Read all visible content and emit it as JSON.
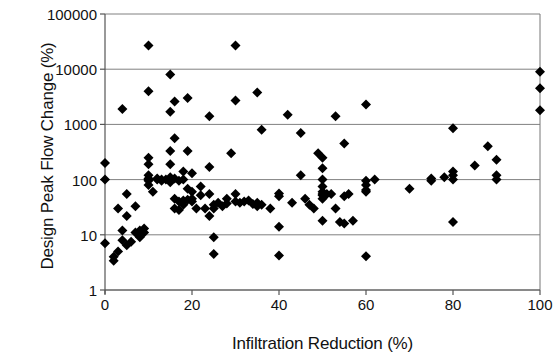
{
  "chart_data": {
    "type": "scatter",
    "title": "",
    "xlabel": "Infiltration Reduction (%)",
    "ylabel": "Design Peak Flow Change (%)",
    "xlim": [
      0,
      100
    ],
    "ylim": [
      1,
      100000
    ],
    "yscale": "log",
    "xscale": "linear",
    "xticks": [
      0,
      20,
      40,
      60,
      80,
      100
    ],
    "xtick_labels": [
      "0",
      "20",
      "40",
      "60",
      "80",
      "100"
    ],
    "yticks": [
      1,
      10,
      100,
      1000,
      10000,
      100000
    ],
    "ytick_labels": [
      "1",
      "10",
      "100",
      "1000",
      "10000",
      "100000"
    ],
    "grid": "horizontal",
    "grid_color": "#808080",
    "marker": "diamond",
    "marker_color": "#000000",
    "marker_size": 5,
    "legend": null,
    "points": [
      [
        0,
        7
      ],
      [
        0,
        100
      ],
      [
        0,
        200
      ],
      [
        2,
        3.4
      ],
      [
        2,
        4.0
      ],
      [
        3,
        5.0
      ],
      [
        3,
        30
      ],
      [
        4,
        1900
      ],
      [
        4,
        8
      ],
      [
        4,
        12
      ],
      [
        5,
        6.5
      ],
      [
        5,
        55
      ],
      [
        5,
        22
      ],
      [
        6,
        7.5
      ],
      [
        7,
        11
      ],
      [
        7,
        33
      ],
      [
        8,
        12
      ],
      [
        8,
        9
      ],
      [
        9,
        11
      ],
      [
        9,
        13
      ],
      [
        10,
        27000
      ],
      [
        10,
        4000
      ],
      [
        10,
        120
      ],
      [
        10,
        190
      ],
      [
        10,
        250
      ],
      [
        10,
        80
      ],
      [
        10,
        95
      ],
      [
        10,
        100
      ],
      [
        10,
        105
      ],
      [
        11,
        60
      ],
      [
        12,
        100
      ],
      [
        12,
        105
      ],
      [
        13,
        100
      ],
      [
        13,
        95
      ],
      [
        14,
        100
      ],
      [
        15,
        8000
      ],
      [
        15,
        1700
      ],
      [
        15,
        330
      ],
      [
        15,
        190
      ],
      [
        15,
        90
      ],
      [
        15,
        100
      ],
      [
        15,
        110
      ],
      [
        16,
        2600
      ],
      [
        16,
        560
      ],
      [
        16,
        105
      ],
      [
        16,
        45
      ],
      [
        16,
        30
      ],
      [
        17,
        95
      ],
      [
        17,
        40
      ],
      [
        17,
        28
      ],
      [
        18,
        140
      ],
      [
        18,
        100
      ],
      [
        18,
        42
      ],
      [
        18,
        35
      ],
      [
        19,
        3000
      ],
      [
        19,
        330
      ],
      [
        19,
        68
      ],
      [
        19,
        43
      ],
      [
        20,
        130
      ],
      [
        20,
        60
      ],
      [
        20,
        45
      ],
      [
        20,
        40
      ],
      [
        21,
        30
      ],
      [
        22,
        75
      ],
      [
        22,
        52
      ],
      [
        23,
        30
      ],
      [
        24,
        1400
      ],
      [
        24,
        170
      ],
      [
        24,
        55
      ],
      [
        24,
        22
      ],
      [
        25,
        4.5
      ],
      [
        25,
        9
      ],
      [
        25,
        30
      ],
      [
        25,
        35
      ],
      [
        26,
        38
      ],
      [
        27,
        33
      ],
      [
        28,
        45
      ],
      [
        28,
        37
      ],
      [
        29,
        300
      ],
      [
        30,
        27000
      ],
      [
        30,
        2700
      ],
      [
        30,
        55
      ],
      [
        30,
        40
      ],
      [
        31,
        38
      ],
      [
        32,
        40
      ],
      [
        33,
        42
      ],
      [
        34,
        36
      ],
      [
        35,
        3800
      ],
      [
        35,
        33
      ],
      [
        35,
        38
      ],
      [
        36,
        800
      ],
      [
        36,
        35
      ],
      [
        38,
        30
      ],
      [
        40,
        4.2
      ],
      [
        40,
        56
      ],
      [
        40,
        50
      ],
      [
        40,
        14
      ],
      [
        42,
        1500
      ],
      [
        43,
        38
      ],
      [
        45,
        700
      ],
      [
        45,
        120
      ],
      [
        46,
        45
      ],
      [
        47,
        35
      ],
      [
        48,
        30
      ],
      [
        49,
        300
      ],
      [
        50,
        55
      ],
      [
        50,
        250
      ],
      [
        50,
        160
      ],
      [
        50,
        100
      ],
      [
        50,
        75
      ],
      [
        50,
        60
      ],
      [
        50,
        52
      ],
      [
        50,
        45
      ],
      [
        50,
        18
      ],
      [
        51,
        55
      ],
      [
        52,
        55
      ],
      [
        53,
        1400
      ],
      [
        53,
        30
      ],
      [
        54,
        17
      ],
      [
        55,
        450
      ],
      [
        55,
        16
      ],
      [
        55,
        50
      ],
      [
        56,
        55
      ],
      [
        57,
        18
      ],
      [
        60,
        2300
      ],
      [
        60,
        4.1
      ],
      [
        60,
        95
      ],
      [
        60,
        80
      ],
      [
        60,
        65
      ],
      [
        60,
        60
      ],
      [
        62,
        100
      ],
      [
        70,
        68
      ],
      [
        75,
        105
      ],
      [
        75,
        95
      ],
      [
        78,
        110
      ],
      [
        80,
        850
      ],
      [
        80,
        120
      ],
      [
        80,
        140
      ],
      [
        80,
        100
      ],
      [
        80,
        17
      ],
      [
        85,
        180
      ],
      [
        88,
        400
      ],
      [
        90,
        230
      ],
      [
        90,
        120
      ],
      [
        90,
        100
      ],
      [
        100,
        9000
      ],
      [
        100,
        4500
      ],
      [
        100,
        1800
      ]
    ]
  }
}
